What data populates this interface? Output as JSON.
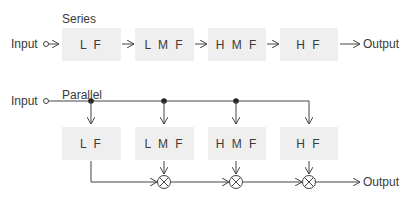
{
  "series": {
    "title": "Series",
    "input_label": "Input",
    "output_label": "Output",
    "blocks": [
      {
        "label": "L F"
      },
      {
        "label": "L M F"
      },
      {
        "label": "H M F"
      },
      {
        "label": "H F"
      }
    ]
  },
  "parallel": {
    "title": "Parallel",
    "input_label": "Input",
    "output_label": "Output",
    "blocks": [
      {
        "label": "L F"
      },
      {
        "label": "L M F"
      },
      {
        "label": "H M F"
      },
      {
        "label": "H F"
      }
    ],
    "combiner_symbol": "multiplier-circle-x"
  },
  "colors": {
    "line": "#444444",
    "block_fill": "#efefef",
    "text": "#3a3a3a"
  }
}
